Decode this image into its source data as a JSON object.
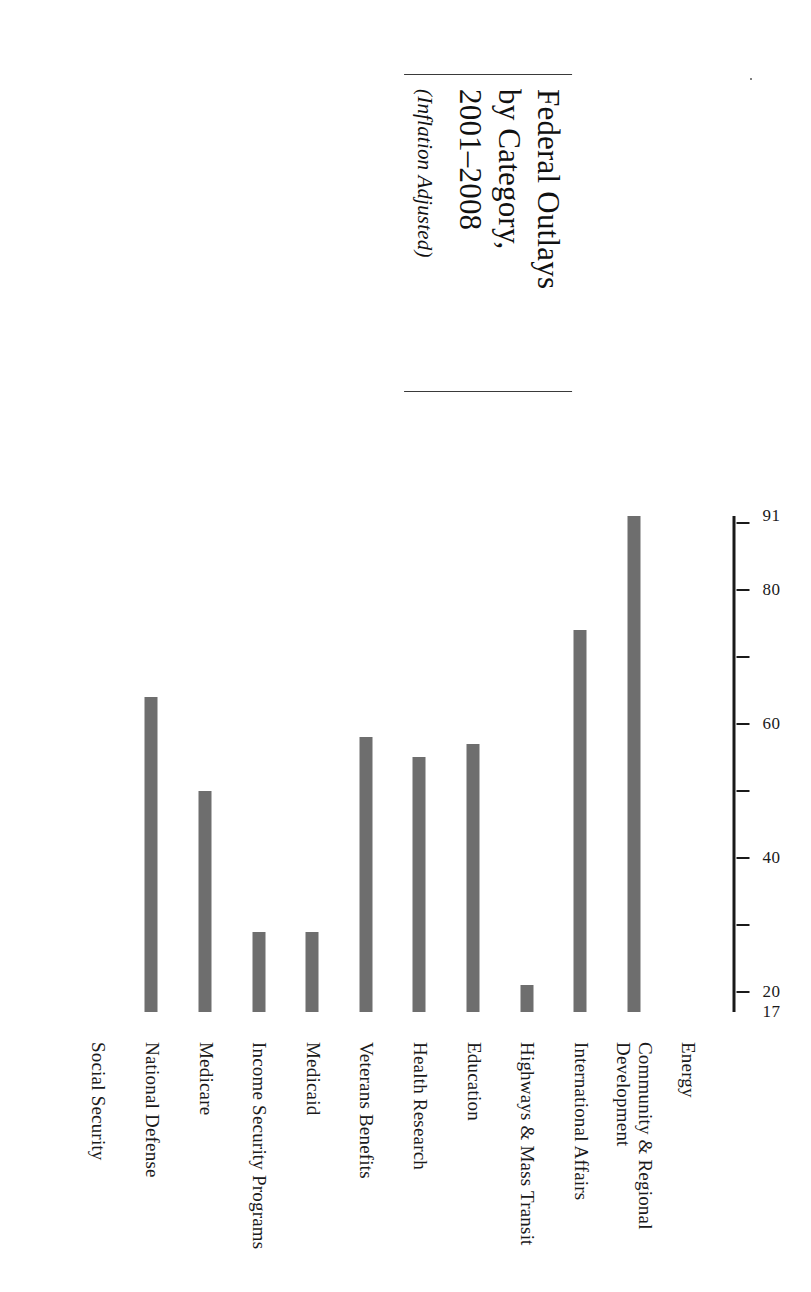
{
  "title": {
    "main_line1": "Federal Outlays",
    "main_line2": "by Category,",
    "main_line3": "2001–2008",
    "subtitle": "(Inflation Adjusted)"
  },
  "chart_data": {
    "type": "bar",
    "title": "Federal Outlays by Category, 2001–2008",
    "subtitle": "(Inflation Adjusted)",
    "orientation": "vertical",
    "xlabel": "",
    "ylabel": "",
    "ylim": [
      17,
      91
    ],
    "grid": false,
    "legend": "none",
    "axis_ticks": [
      20,
      30,
      40,
      50,
      60,
      70,
      80,
      90
    ],
    "tick_labels_shown": [
      "17",
      "20",
      "40",
      "60",
      "80",
      "91"
    ],
    "axis_start_label": "17",
    "axis_end_label": "91",
    "categories": [
      "Energy",
      "Community & Regional Development",
      "International Affairs",
      "Highways & Mass Transit",
      "Education",
      "Health Research",
      "Veterans Benefits",
      "Medicaid",
      "Income Security Programs",
      "Medicare",
      "National Defense",
      "Social Security"
    ],
    "values": [
      17,
      91,
      74,
      21,
      57,
      55,
      58,
      29,
      29,
      50,
      64,
      16
    ],
    "bar_color": "#6e6e6e"
  },
  "category_labels": [
    {
      "lines": [
        "Energy"
      ]
    },
    {
      "lines": [
        "Community & Regional",
        "Development"
      ]
    },
    {
      "lines": [
        "International Affairs"
      ]
    },
    {
      "lines": [
        "Highways & Mass Transit"
      ]
    },
    {
      "lines": [
        "Education"
      ]
    },
    {
      "lines": [
        "Health Research"
      ]
    },
    {
      "lines": [
        "Veterans Benefits"
      ]
    },
    {
      "lines": [
        "Medicaid"
      ]
    },
    {
      "lines": [
        "Income Security Programs"
      ]
    },
    {
      "lines": [
        "Medicare"
      ]
    },
    {
      "lines": [
        "National Defense"
      ]
    },
    {
      "lines": [
        "Social Security"
      ]
    }
  ]
}
